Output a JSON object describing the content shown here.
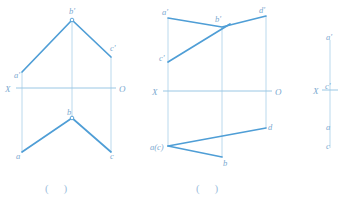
{
  "page": {
    "background": "#ffffff",
    "width": 338,
    "height": 209
  },
  "colors": {
    "object_line": "#4f9ed6",
    "thin_line": "#a8cfe8",
    "axis_line": "#9ac7e4",
    "label_text": "#7ba9d0",
    "caption_text": "#9dc0dd",
    "vertex_marker_fill": "#ffffff",
    "vertex_marker_stroke": "#4f9ed6"
  },
  "figures": [
    {
      "id": "figure-1",
      "caption": "(     )",
      "axis": {
        "x_label": "X",
        "o_label": "O",
        "y": 88,
        "x1": 16,
        "x2": 116
      },
      "front_view_labels": [
        {
          "name": "a-prime",
          "text": "a'",
          "x": 14,
          "y": 78
        },
        {
          "name": "b-prime",
          "text": "b'",
          "x": 69,
          "y": 14
        },
        {
          "name": "c-prime",
          "text": "c'",
          "x": 110,
          "y": 51
        }
      ],
      "top_view_labels": [
        {
          "name": "a",
          "text": "a",
          "x": 16,
          "y": 156
        },
        {
          "name": "b",
          "text": "b",
          "x": 68,
          "y": 115
        },
        {
          "name": "c",
          "text": "c",
          "x": 110,
          "y": 156
        }
      ]
    },
    {
      "id": "figure-2",
      "caption": "(     )",
      "axis": {
        "x_label": "X",
        "o_label": "O",
        "y": 91,
        "x1": 163,
        "x2": 272
      },
      "front_view_labels": [
        {
          "name": "a-prime",
          "text": "a'",
          "x": 163,
          "y": 14
        },
        {
          "name": "b-prime",
          "text": "b'",
          "x": 214,
          "y": 22
        },
        {
          "name": "d-prime",
          "text": "d'",
          "x": 259,
          "y": 12
        },
        {
          "name": "c-prime",
          "text": "c'",
          "x": 161,
          "y": 58
        }
      ],
      "top_view_labels": [
        {
          "name": "a-c-coincident",
          "text": "a(c)",
          "x": 152,
          "y": 148
        },
        {
          "name": "b",
          "text": "b",
          "x": 223,
          "y": 162
        },
        {
          "name": "d",
          "text": "d",
          "x": 262,
          "y": 130
        }
      ]
    },
    {
      "id": "figure-3",
      "caption": "",
      "axis": {
        "x_label": "X",
        "o_label": "",
        "y": 90,
        "x1": 318,
        "x2": 338
      },
      "front_view_labels": [
        {
          "name": "a-prime",
          "text": "a'",
          "x": 327,
          "y": 38
        },
        {
          "name": "c-prime",
          "text": "c'",
          "x": 326,
          "y": 87
        }
      ],
      "top_view_labels": [
        {
          "name": "a",
          "text": "a",
          "x": 327,
          "y": 128
        },
        {
          "name": "c",
          "text": "c",
          "x": 327,
          "y": 147
        }
      ]
    }
  ],
  "captions": {
    "figure1": "(     )",
    "figure2": "(     )"
  }
}
